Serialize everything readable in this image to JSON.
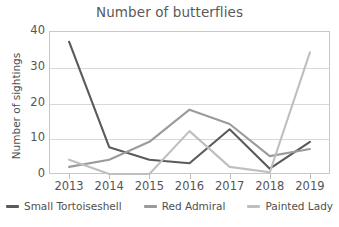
{
  "chart_data": {
    "type": "line",
    "title": "Number of butterflies",
    "xlabel": "",
    "ylabel": "Number of sightings",
    "categories": [
      "2013",
      "2014",
      "2015",
      "2016",
      "2017",
      "2018",
      "2019"
    ],
    "x": [
      2013,
      2014,
      2015,
      2016,
      2017,
      2018,
      2019
    ],
    "ylim": [
      0,
      40
    ],
    "yticks": [
      0,
      10,
      20,
      30,
      40
    ],
    "grid": true,
    "legend_position": "bottom",
    "series": [
      {
        "name": "Small Tortoiseshell",
        "color": "#5a5a5a",
        "values": [
          37,
          7.5,
          4,
          3,
          12.5,
          1.5,
          9
        ]
      },
      {
        "name": "Red Admiral",
        "color": "#9b9b9b",
        "values": [
          2,
          4,
          9,
          18,
          14,
          5,
          7
        ]
      },
      {
        "name": "Painted Lady",
        "color": "#bfbfbf",
        "values": [
          4,
          0,
          0,
          12,
          2,
          0.5,
          34
        ]
      }
    ]
  },
  "axis": {
    "y_ticks": [
      "40",
      "30",
      "20",
      "10",
      "0"
    ],
    "x_ticks": [
      "2013",
      "2014",
      "2015",
      "2016",
      "2017",
      "2018",
      "2019"
    ]
  },
  "legend": {
    "items": [
      {
        "label": "Small Tortoiseshell",
        "color": "#5a5a5a"
      },
      {
        "label": "Red Admiral",
        "color": "#9b9b9b"
      },
      {
        "label": "Painted Lady",
        "color": "#bfbfbf"
      }
    ]
  }
}
